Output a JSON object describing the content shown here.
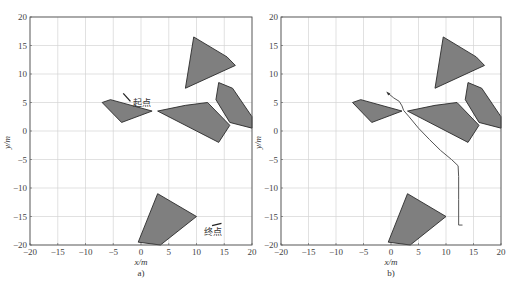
{
  "chart_data": [
    {
      "type": "scatter",
      "panel_label": "a)",
      "title": "",
      "xlabel": "x/m",
      "ylabel": "y/m",
      "xlim": [
        -20,
        20
      ],
      "ylim": [
        -20,
        20
      ],
      "xticks": [
        -20,
        -15,
        -10,
        -5,
        0,
        5,
        10,
        15,
        20
      ],
      "yticks": [
        20,
        15,
        10,
        5,
        0,
        -5,
        -10,
        -15,
        -20
      ],
      "grid": true,
      "obstacles": [
        [
          [
            8,
            7.5
          ],
          [
            9.5,
            16.5
          ],
          [
            15.5,
            13
          ],
          [
            17,
            11.5
          ]
        ],
        [
          [
            14,
            8.5
          ],
          [
            16.5,
            7.5
          ],
          [
            20,
            2.5
          ],
          [
            20,
            0.5
          ],
          [
            16,
            1.5
          ],
          [
            13.5,
            5.5
          ]
        ],
        [
          [
            3,
            3.5
          ],
          [
            8,
            4.5
          ],
          [
            12,
            5
          ],
          [
            16,
            1
          ],
          [
            14,
            -2
          ]
        ],
        [
          [
            -7,
            5
          ],
          [
            -5.5,
            5.5
          ],
          [
            2,
            3.5
          ],
          [
            -3.5,
            1.5
          ]
        ],
        [
          [
            -0.5,
            -19.5
          ],
          [
            3,
            -11
          ],
          [
            10,
            -15
          ],
          [
            3.5,
            -20
          ]
        ]
      ],
      "obstacle_color": "#7f7f7f",
      "annotations": [
        {
          "text": "起点",
          "x": -1.5,
          "y": 4.3,
          "arrow_from": [
            -3.2,
            6.6
          ],
          "arrow_to": [
            -1.9,
            5.2
          ]
        },
        {
          "text": "终点",
          "x": 11.4,
          "y": -18.3,
          "arrow_from": [
            14.5,
            -16.2
          ],
          "arrow_to": [
            12.8,
            -16.6
          ]
        }
      ],
      "path": []
    },
    {
      "type": "line",
      "panel_label": "b)",
      "title": "",
      "xlabel": "x/m",
      "ylabel": "y/m",
      "xlim": [
        -20,
        20
      ],
      "ylim": [
        -20,
        20
      ],
      "xticks": [
        -20,
        -15,
        -10,
        -5,
        0,
        5,
        10,
        15,
        20
      ],
      "yticks": [
        20,
        15,
        10,
        5,
        0,
        -5,
        -10,
        -15,
        -20
      ],
      "grid": true,
      "obstacles": [
        [
          [
            8,
            7.5
          ],
          [
            9.5,
            16.5
          ],
          [
            15.5,
            13
          ],
          [
            17,
            11.5
          ]
        ],
        [
          [
            14,
            8.5
          ],
          [
            16.5,
            7.5
          ],
          [
            20,
            2.5
          ],
          [
            20,
            0.5
          ],
          [
            16,
            1.5
          ],
          [
            13.5,
            5.5
          ]
        ],
        [
          [
            3,
            3.5
          ],
          [
            8,
            4.5
          ],
          [
            12,
            5
          ],
          [
            16,
            1
          ],
          [
            14,
            -2
          ]
        ],
        [
          [
            -7,
            5
          ],
          [
            -5.5,
            5.5
          ],
          [
            2,
            3.5
          ],
          [
            -3.5,
            1.5
          ]
        ],
        [
          [
            -0.5,
            -19.5
          ],
          [
            3,
            -11
          ],
          [
            10,
            -15
          ],
          [
            3.5,
            -20
          ]
        ]
      ],
      "obstacle_color": "#7f7f7f",
      "annotations": [],
      "path": [
        [
          -0.5,
          6.6
        ],
        [
          0.5,
          5.8
        ],
        [
          1.5,
          5.2
        ],
        [
          2,
          4.4
        ],
        [
          2.3,
          3.6
        ],
        [
          3.2,
          2.6
        ],
        [
          5,
          0.5
        ],
        [
          7,
          -1.5
        ],
        [
          9,
          -3.4
        ],
        [
          11,
          -5
        ],
        [
          12.2,
          -6.1
        ],
        [
          12.3,
          -8
        ],
        [
          12.3,
          -12
        ],
        [
          12.3,
          -16.5
        ],
        [
          13,
          -16.5
        ]
      ],
      "path_color": "#555555"
    }
  ]
}
